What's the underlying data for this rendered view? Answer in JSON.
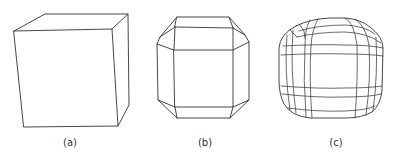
{
  "figure": {
    "panels": [
      {
        "id": "a",
        "label": "(a)",
        "description": "cube",
        "center_x": 70
      },
      {
        "id": "b",
        "label": "(b)",
        "description": "cube with beveled edges",
        "center_x": 205
      },
      {
        "id": "c",
        "label": "(c)",
        "description": "subdivided rounded cube",
        "center_x": 336
      }
    ],
    "colors": {
      "stroke": "#333333",
      "background": "#ffffff"
    }
  }
}
